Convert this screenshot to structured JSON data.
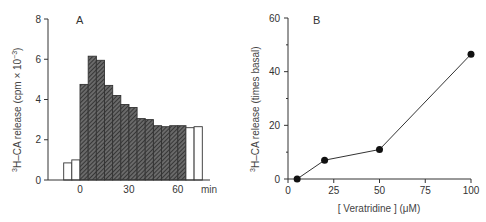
{
  "chart_data": [
    {
      "type": "bar",
      "panel_label": "A",
      "title": "",
      "xlabel": "min",
      "ylabel": "3H-CA release (cpm x 10^-3)",
      "ylabel_parts": {
        "sup": "3",
        "main": "H–CA release (cpm × 10",
        "exp": "−3",
        "close": ")"
      },
      "ylim": [
        0,
        8
      ],
      "yticks": [
        "0",
        "2",
        "4",
        "6",
        "8"
      ],
      "xticks": [
        {
          "label": "0",
          "value": 0
        },
        {
          "label": "30",
          "value": 30
        },
        {
          "label": "60",
          "value": 60
        }
      ],
      "x_unit_label": "min",
      "grid": false,
      "bars": [
        {
          "t": -10,
          "value": 0.85,
          "style": "open"
        },
        {
          "t": -5,
          "value": 1.0,
          "style": "open"
        },
        {
          "t": 0,
          "value": 4.75,
          "style": "hatched"
        },
        {
          "t": 5,
          "value": 6.15,
          "style": "hatched"
        },
        {
          "t": 10,
          "value": 5.95,
          "style": "hatched"
        },
        {
          "t": 15,
          "value": 4.7,
          "style": "hatched"
        },
        {
          "t": 20,
          "value": 4.2,
          "style": "hatched"
        },
        {
          "t": 25,
          "value": 3.75,
          "style": "hatched"
        },
        {
          "t": 30,
          "value": 3.6,
          "style": "hatched"
        },
        {
          "t": 35,
          "value": 3.05,
          "style": "hatched"
        },
        {
          "t": 40,
          "value": 3.0,
          "style": "hatched"
        },
        {
          "t": 45,
          "value": 2.7,
          "style": "hatched"
        },
        {
          "t": 50,
          "value": 2.65,
          "style": "hatched"
        },
        {
          "t": 55,
          "value": 2.7,
          "style": "hatched"
        },
        {
          "t": 60,
          "value": 2.7,
          "style": "hatched"
        },
        {
          "t": 65,
          "value": 2.6,
          "style": "open"
        },
        {
          "t": 70,
          "value": 2.65,
          "style": "open"
        }
      ]
    },
    {
      "type": "line",
      "panel_label": "B",
      "title": "",
      "xlabel": "[ Veratridine ] (μM)",
      "ylabel": "3H-CA release (times basal)",
      "ylabel_parts": {
        "sup": "3",
        "main": "H–CA release (times basal)"
      },
      "xlim": [
        0,
        100
      ],
      "ylim": [
        0,
        60
      ],
      "xticks": [
        "0",
        "25",
        "50",
        "75",
        "100"
      ],
      "yticks": [
        "0",
        "20",
        "40",
        "60"
      ],
      "grid": false,
      "x": [
        5,
        20,
        50,
        100
      ],
      "values": [
        0,
        7,
        11,
        46.5
      ],
      "series": [
        {
          "name": "Veratridine response",
          "x": [
            5,
            20,
            50,
            100
          ],
          "values": [
            0,
            7,
            11,
            46.5
          ]
        }
      ]
    }
  ]
}
